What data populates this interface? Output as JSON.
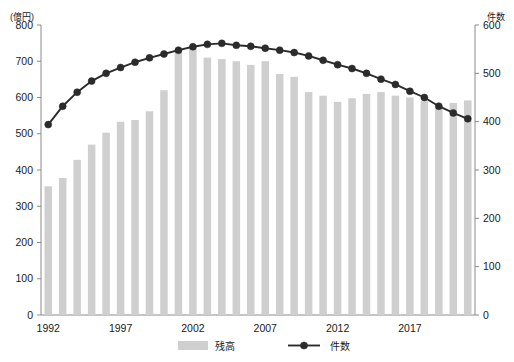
{
  "chart_data": {
    "type": "bar",
    "title": "",
    "xlabel": "",
    "ylabel": "(億円)",
    "y2label": "件数",
    "ylim": [
      0,
      800
    ],
    "y2lim": [
      0,
      600
    ],
    "yticks": [
      0,
      100,
      200,
      300,
      400,
      500,
      600,
      700,
      800
    ],
    "y2ticks": [
      0,
      100,
      200,
      300,
      400,
      500,
      600
    ],
    "xticks_labeled": [
      "1992",
      "1997",
      "2002",
      "2007",
      "2012",
      "2017"
    ],
    "grid": false,
    "legend_position": "bottom",
    "categories": [
      "1992",
      "1993",
      "1994",
      "1995",
      "1996",
      "1997",
      "1998",
      "1999",
      "2000",
      "2001",
      "2002",
      "2003",
      "2004",
      "2005",
      "2006",
      "2007",
      "2008",
      "2009",
      "2010",
      "2011",
      "2012",
      "2013",
      "2014",
      "2015",
      "2016",
      "2017",
      "2018",
      "2019",
      "2020",
      "2021"
    ],
    "series": [
      {
        "name": "残高",
        "type": "bar",
        "axis": "left",
        "unit": "億円",
        "color": "#cfcfcf",
        "values": [
          355,
          378,
          428,
          470,
          503,
          533,
          538,
          562,
          620,
          735,
          742,
          710,
          706,
          700,
          690,
          700,
          665,
          657,
          615,
          605,
          588,
          598,
          610,
          615,
          605,
          600,
          590,
          572,
          585,
          592
        ]
      },
      {
        "name": "件数",
        "type": "line",
        "axis": "right",
        "unit": "件",
        "color": "#2b2b2b",
        "values": [
          394,
          432,
          461,
          484,
          500,
          512,
          523,
          532,
          540,
          548,
          555,
          560,
          562,
          558,
          556,
          552,
          548,
          543,
          536,
          527,
          518,
          510,
          500,
          488,
          477,
          463,
          450,
          432,
          418,
          406
        ]
      }
    ]
  },
  "legend": {
    "items": [
      {
        "label": "残高",
        "marker": "bar-swatch"
      },
      {
        "label": "件数",
        "marker": "line-dot"
      }
    ]
  }
}
